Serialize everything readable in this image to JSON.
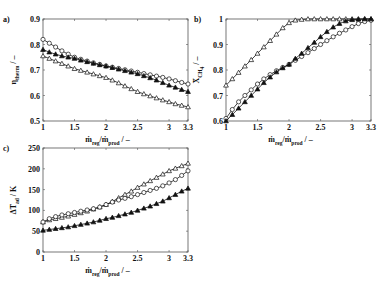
{
  "chart_data": [
    {
      "panel": "a)",
      "type": "line",
      "title": "",
      "xlabel": "ṁ_reg/ṁ_prod / –",
      "ylabel": "η_therm / –",
      "xlim": [
        1,
        3.3
      ],
      "ylim": [
        0.5,
        0.9
      ],
      "xticks": [
        "1",
        "1.5",
        "2",
        "2.5",
        "3",
        "3.3"
      ],
      "yticks": [
        "0.5",
        "0.6",
        "0.7",
        "0.8",
        "0.9"
      ],
      "grid": false,
      "x": [
        1.0,
        1.1,
        1.2,
        1.3,
        1.4,
        1.5,
        1.6,
        1.7,
        1.8,
        1.9,
        2.0,
        2.1,
        2.2,
        2.3,
        2.4,
        2.5,
        2.6,
        2.7,
        2.8,
        2.9,
        3.0,
        3.1,
        3.2,
        3.3
      ],
      "series": [
        {
          "name": "open circle",
          "marker": "circle-open",
          "values": [
            0.82,
            0.805,
            0.79,
            0.775,
            0.762,
            0.75,
            0.742,
            0.735,
            0.728,
            0.722,
            0.716,
            0.711,
            0.706,
            0.701,
            0.696,
            0.691,
            0.686,
            0.681,
            0.676,
            0.671,
            0.665,
            0.658,
            0.651,
            0.645
          ]
        },
        {
          "name": "filled triangle",
          "marker": "triangle-filled",
          "values": [
            0.78,
            0.77,
            0.762,
            0.755,
            0.75,
            0.745,
            0.738,
            0.732,
            0.726,
            0.72,
            0.715,
            0.709,
            0.703,
            0.697,
            0.691,
            0.685,
            0.677,
            0.669,
            0.66,
            0.65,
            0.64,
            0.632,
            0.623,
            0.615
          ]
        },
        {
          "name": "open triangle",
          "marker": "triangle-open",
          "values": [
            0.755,
            0.745,
            0.735,
            0.725,
            0.715,
            0.705,
            0.698,
            0.691,
            0.684,
            0.677,
            0.67,
            0.66,
            0.649,
            0.637,
            0.626,
            0.615,
            0.606,
            0.598,
            0.59,
            0.582,
            0.575,
            0.567,
            0.561,
            0.555
          ]
        }
      ]
    },
    {
      "panel": "b)",
      "type": "line",
      "title": "",
      "xlabel": "ṁ_reg/ṁ_prod / –",
      "ylabel": "X̄_CH4 / –",
      "xlim": [
        1,
        3.3
      ],
      "ylim": [
        0.6,
        1.0
      ],
      "xticks": [
        "1",
        "1.5",
        "2",
        "2.5",
        "3",
        "3.3"
      ],
      "yticks": [
        "0.6",
        "0.7",
        "0.8",
        "0.9",
        "1"
      ],
      "grid": false,
      "x": [
        1.0,
        1.1,
        1.2,
        1.3,
        1.4,
        1.5,
        1.6,
        1.7,
        1.8,
        1.9,
        2.0,
        2.1,
        2.2,
        2.3,
        2.4,
        2.5,
        2.6,
        2.7,
        2.8,
        2.9,
        3.0,
        3.1,
        3.2,
        3.3
      ],
      "series": [
        {
          "name": "open triangle",
          "marker": "triangle-open",
          "values": [
            0.74,
            0.765,
            0.79,
            0.815,
            0.84,
            0.865,
            0.89,
            0.915,
            0.94,
            0.965,
            0.985,
            0.995,
            0.998,
            1.0,
            1.0,
            1.0,
            1.0,
            1.0,
            1.0,
            1.0,
            1.0,
            1.0,
            1.0,
            1.0
          ]
        },
        {
          "name": "open circle",
          "marker": "circle-open",
          "values": [
            0.61,
            0.645,
            0.675,
            0.7,
            0.722,
            0.745,
            0.765,
            0.782,
            0.797,
            0.81,
            0.822,
            0.838,
            0.853,
            0.868,
            0.884,
            0.9,
            0.915,
            0.93,
            0.944,
            0.957,
            0.97,
            0.982,
            0.99,
            0.995
          ]
        },
        {
          "name": "filled triangle",
          "marker": "triangle-filled",
          "values": [
            0.6,
            0.625,
            0.65,
            0.675,
            0.7,
            0.725,
            0.75,
            0.772,
            0.792,
            0.808,
            0.822,
            0.845,
            0.865,
            0.887,
            0.908,
            0.93,
            0.95,
            0.968,
            0.982,
            0.992,
            0.997,
            0.999,
            1.0,
            1.0
          ]
        }
      ]
    },
    {
      "panel": "c)",
      "type": "line",
      "title": "",
      "xlabel": "ṁ_reg/ṁ_prod / –",
      "ylabel": "ΔT̄_ad / K",
      "xlim": [
        1,
        3.3
      ],
      "ylim": [
        0,
        250
      ],
      "xticks": [
        "1",
        "1.5",
        "2",
        "2.5",
        "3",
        "3.3"
      ],
      "yticks": [
        "0",
        "50",
        "100",
        "150",
        "200",
        "250"
      ],
      "grid": false,
      "x": [
        1.0,
        1.1,
        1.2,
        1.3,
        1.4,
        1.5,
        1.6,
        1.7,
        1.8,
        1.9,
        2.0,
        2.1,
        2.2,
        2.3,
        2.4,
        2.5,
        2.6,
        2.7,
        2.8,
        2.9,
        3.0,
        3.1,
        3.2,
        3.3
      ],
      "series": [
        {
          "name": "open triangle",
          "marker": "triangle-open",
          "values": [
            72,
            77,
            80,
            83,
            86,
            90,
            94,
            98,
            103,
            108,
            114,
            121,
            130,
            138,
            146,
            155,
            163,
            171,
            179,
            187,
            195,
            201,
            207,
            213
          ]
        },
        {
          "name": "open circle",
          "marker": "circle-open",
          "values": [
            72,
            80,
            85,
            89,
            92,
            95,
            98,
            101,
            104,
            108,
            114,
            120,
            125,
            129,
            133,
            138,
            143,
            148,
            153,
            159,
            166,
            174,
            184,
            195
          ]
        },
        {
          "name": "filled triangle",
          "marker": "triangle-filled",
          "values": [
            52,
            54,
            56,
            58,
            60,
            63,
            66,
            69,
            72,
            76,
            80,
            83,
            87,
            91,
            95,
            100,
            105,
            110,
            116,
            122,
            130,
            138,
            146,
            153
          ]
        }
      ]
    }
  ],
  "labels": {
    "panel_a": "a)",
    "panel_b": "b)",
    "panel_c": "c)",
    "x_main": "ṁ",
    "x_reg_sub": "reg",
    "x_slash": "/ṁ",
    "x_prod_sub": "prod",
    "x_unit": " / –",
    "ya_main": "η",
    "ya_sub": "therm",
    "ya_unit": " / –",
    "yb_main": "X̄",
    "yb_sub": "CH",
    "yb_sub2": "4",
    "yb_unit": " / –",
    "yc_main": "ΔT̄",
    "yc_sub": "ad",
    "yc_unit": " / K"
  },
  "colors": {
    "line": "#111111",
    "axis": "#555555",
    "background": "#ffffff"
  }
}
